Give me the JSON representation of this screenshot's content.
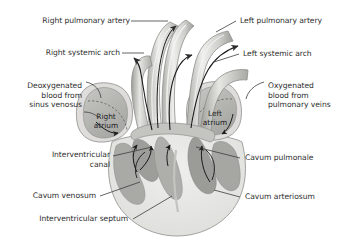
{
  "figure": {
    "background_color": "#ffffff",
    "label_color": "#2e2e2e",
    "leader_color": "#3c3c3c",
    "arrow_color": "#1a1a1a"
  },
  "palette": {
    "vessel_light": "#e8e8e6",
    "vessel_mid": "#c9c9c6",
    "vessel_dark": "#a9a9a5",
    "atrium_fill": "#b9b9b6",
    "atrium_wall": "#dcdcd9",
    "ventricle_fill": "#e2e2df",
    "trabecula_fill": "#a2a2a0",
    "outline": "#8a8a87"
  },
  "labels": {
    "right_pulmonary_artery": "Right pulmonary artery",
    "left_pulmonary_artery": "Left pulmonary artery",
    "right_systemic_arch": "Right systemic arch",
    "left_systemic_arch": "Left systemic arch",
    "deoxygenated": "Deoxygenated\nblood from\nsinus venosus",
    "oxygenated": "Oxygenated\nblood from\npulmonary veins",
    "right_atrium": "Right\natrium",
    "left_atrium": "Left\natrium",
    "interventricular_canal": "Interventricular\ncanal",
    "cavum_pulmonale": "Cavum pulmonale",
    "cavum_venosum": "Cavum venosum",
    "cavum_arteriosum": "Cavum arteriosum",
    "interventricular_septum": "Interventricular septum"
  }
}
